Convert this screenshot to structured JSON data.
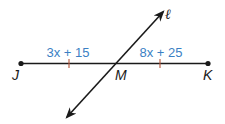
{
  "diagram": {
    "segment": {
      "endpoint_left": "J",
      "endpoint_right": "K",
      "midpoint": "M"
    },
    "line_label": "ℓ",
    "expressions": {
      "left": "3x + 15",
      "right": "8x + 25"
    },
    "colors": {
      "line": "#1a1a1a",
      "expression": "#3b7fc4",
      "tick": "#b5553a"
    },
    "congruence_ticks": 2
  }
}
